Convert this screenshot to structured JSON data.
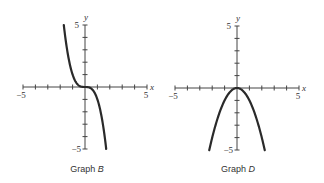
{
  "chart_data": [
    {
      "type": "line",
      "title": "Graph B",
      "caption_prefix": "Graph",
      "caption_letter": "B",
      "xlabel": "x",
      "ylabel": "y",
      "xlim": [
        -5,
        5
      ],
      "ylim": [
        -5,
        5
      ],
      "x_tick_labels": [
        "-5",
        "5"
      ],
      "y_tick_labels": [
        "5",
        "-5"
      ],
      "ticks_every": 1,
      "grid": false,
      "function": "y = -x^3",
      "series": [
        {
          "name": "curve",
          "x": [
            -1.71,
            -1.5,
            -1.25,
            -1.0,
            -0.75,
            -0.5,
            -0.25,
            0,
            0.25,
            0.5,
            0.75,
            1.0,
            1.25,
            1.5,
            1.71
          ],
          "y": [
            5.0,
            3.38,
            1.95,
            1.0,
            0.42,
            0.13,
            0.02,
            0,
            -0.02,
            -0.13,
            -0.42,
            -1.0,
            -1.95,
            -3.38,
            -5.0
          ]
        }
      ]
    },
    {
      "type": "line",
      "title": "Graph D",
      "caption_prefix": "Graph",
      "caption_letter": "D",
      "xlabel": "x",
      "ylabel": "y",
      "xlim": [
        -5,
        5
      ],
      "ylim": [
        -5,
        5
      ],
      "x_tick_labels": [
        "-5",
        "5"
      ],
      "y_tick_labels": [
        "5",
        "-5"
      ],
      "ticks_every": 1,
      "grid": false,
      "function": "y = -x^2",
      "series": [
        {
          "name": "curve",
          "x": [
            -2.24,
            -2.0,
            -1.5,
            -1.0,
            -0.5,
            0,
            0.5,
            1.0,
            1.5,
            2.0,
            2.24
          ],
          "y": [
            -5.0,
            -4.0,
            -2.25,
            -1.0,
            -0.25,
            0,
            -0.25,
            -1.0,
            -2.25,
            -4.0,
            -5.0
          ]
        }
      ]
    }
  ],
  "graphs": [
    {
      "caption_prefix": "Graph",
      "caption_letter": "B",
      "x_axis_label": "x",
      "y_axis_label": "y",
      "x_min_label": "−5",
      "x_max_label": "5",
      "y_max_label": "5",
      "y_min_label": "−5"
    },
    {
      "caption_prefix": "Graph",
      "caption_letter": "D",
      "x_axis_label": "x",
      "y_axis_label": "y",
      "x_min_label": "−5",
      "x_max_label": "5",
      "y_max_label": "5",
      "y_min_label": "−5"
    }
  ],
  "colors": {
    "axis": "#444444",
    "curve": "#2a2a2a",
    "text": "#333333"
  }
}
